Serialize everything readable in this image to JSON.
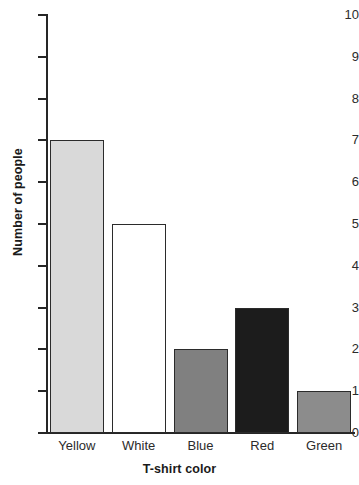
{
  "chart_data": {
    "type": "bar",
    "title": "",
    "xlabel": "T-shirt color",
    "ylabel": "Number of people",
    "categories": [
      "Yellow",
      "White",
      "Blue",
      "Red",
      "Green"
    ],
    "values": [
      7,
      5,
      2,
      3,
      1
    ],
    "series": [
      {
        "name": "Number of people",
        "values": [
          7,
          5,
          2,
          3,
          1
        ]
      }
    ],
    "bar_fill_colors": [
      "#d9d9d9",
      "#ffffff",
      "#808080",
      "#1c1c1c",
      "#8c8c8c"
    ],
    "bar_border_color": "#2b2b2b",
    "ylim": [
      0,
      10
    ],
    "xlim_categories": 5,
    "ytick_labels": [
      "0",
      "1",
      "2",
      "3",
      "4",
      "5",
      "6",
      "7",
      "8",
      "9",
      "10"
    ],
    "ytick_values": [
      0,
      1,
      2,
      3,
      4,
      5,
      6,
      7,
      8,
      9,
      10
    ],
    "grid": false,
    "legend": false,
    "legend_position": "none",
    "axis_color": "#262626"
  }
}
